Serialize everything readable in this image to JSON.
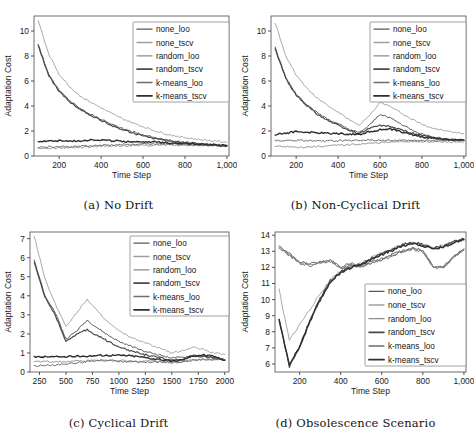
{
  "figure": {
    "series_names": [
      "none_loo",
      "none_tscv",
      "random_loo",
      "random_tscv",
      "k-means_loo",
      "k-means_tscv"
    ],
    "series_colors": [
      "#5a5a5a",
      "#9e9e9e",
      "#8c8c8c",
      "#4a4a4a",
      "#6e6e6e",
      "#2e2e2e"
    ],
    "series_widths": [
      1.0,
      0.9,
      0.9,
      1.2,
      1.0,
      1.4
    ]
  },
  "panels": [
    {
      "id": "a",
      "caption": "(a) No Drift",
      "chart_data": {
        "type": "line",
        "title": "(a) No Drift",
        "xlabel": "Time Step",
        "ylabel": "Adaptation Cost",
        "xlim": [
          80,
          1010
        ],
        "ylim": [
          0,
          11.2
        ],
        "xticks": [
          200,
          400,
          600,
          800,
          1000
        ],
        "xticklabels": [
          "200",
          "400",
          "600",
          "800",
          "1,000"
        ],
        "yticks": [
          0,
          2,
          4,
          6,
          8,
          10
        ],
        "yticklabels": [
          "0",
          "2",
          "4",
          "6",
          "8",
          "10"
        ],
        "grid": false,
        "legend_position": "upper right",
        "x": [
          100,
          150,
          200,
          250,
          300,
          350,
          400,
          450,
          500,
          550,
          600,
          650,
          700,
          750,
          800,
          850,
          900,
          950,
          1000
        ],
        "series": [
          {
            "name": "none_loo",
            "values": [
              8.95,
              6.5,
              5.25,
              4.45,
              3.8,
              3.35,
              2.95,
              2.55,
              2.2,
              1.95,
              1.7,
              1.5,
              1.32,
              1.2,
              1.1,
              1.02,
              0.96,
              0.9,
              0.86
            ]
          },
          {
            "name": "none_tscv",
            "values": [
              10.85,
              8.15,
              6.55,
              5.55,
              4.8,
              4.3,
              3.85,
              3.4,
              3.0,
              2.65,
              2.35,
              2.05,
              1.8,
              1.62,
              1.48,
              1.36,
              1.26,
              1.18,
              1.1
            ]
          },
          {
            "name": "random_loo",
            "values": [
              0.62,
              0.63,
              0.64,
              0.66,
              0.68,
              0.72,
              0.78,
              0.8,
              0.8,
              0.82,
              0.84,
              0.86,
              0.88,
              0.88,
              0.87,
              0.86,
              0.84,
              0.82,
              0.8
            ]
          },
          {
            "name": "random_tscv",
            "values": [
              8.85,
              6.45,
              5.15,
              4.35,
              3.72,
              3.25,
              2.85,
              2.45,
              2.12,
              1.86,
              1.62,
              1.42,
              1.26,
              1.14,
              1.05,
              0.98,
              0.92,
              0.87,
              0.84
            ]
          },
          {
            "name": "k-means_loo",
            "values": [
              0.72,
              0.74,
              0.75,
              0.76,
              0.78,
              0.82,
              0.86,
              0.88,
              0.9,
              0.92,
              0.94,
              0.95,
              0.95,
              0.94,
              0.92,
              0.9,
              0.88,
              0.86,
              0.84
            ]
          },
          {
            "name": "k-means_tscv",
            "values": [
              1.18,
              1.2,
              1.22,
              1.18,
              1.22,
              1.3,
              1.28,
              1.22,
              1.18,
              1.16,
              1.14,
              1.12,
              1.08,
              1.04,
              1.0,
              0.96,
              0.92,
              0.88,
              0.82
            ]
          }
        ]
      }
    },
    {
      "id": "b",
      "caption": "(b) Non-Cyclical Drift",
      "chart_data": {
        "type": "line",
        "title": "(b) Non-Cyclical Drift",
        "xlabel": "Time Step",
        "ylabel": "Adaptation Cost",
        "xlim": [
          80,
          1010
        ],
        "ylim": [
          0,
          11.2
        ],
        "xticks": [
          200,
          400,
          600,
          800,
          1000
        ],
        "xticklabels": [
          "200",
          "400",
          "600",
          "800",
          "1,000"
        ],
        "yticks": [
          0,
          2,
          4,
          6,
          8,
          10
        ],
        "yticklabels": [
          "0",
          "2",
          "4",
          "6",
          "8",
          "10"
        ],
        "grid": false,
        "legend_position": "upper right",
        "x": [
          100,
          150,
          200,
          250,
          300,
          350,
          400,
          450,
          500,
          550,
          600,
          650,
          700,
          750,
          800,
          850,
          900,
          950,
          1000
        ],
        "series": [
          {
            "name": "none_loo",
            "values": [
              8.65,
              6.3,
              4.95,
              4.15,
              3.45,
              2.95,
              2.55,
              2.15,
              1.85,
              2.45,
              3.35,
              3.05,
              2.55,
              2.1,
              1.75,
              1.55,
              1.4,
              1.3,
              1.25
            ]
          },
          {
            "name": "none_tscv",
            "values": [
              10.65,
              8.05,
              6.5,
              5.45,
              4.65,
              4.05,
              3.5,
              2.95,
              2.42,
              3.25,
              4.28,
              3.95,
              3.45,
              2.95,
              2.55,
              2.25,
              2.05,
              1.9,
              1.8
            ]
          },
          {
            "name": "random_loo",
            "values": [
              0.78,
              0.74,
              0.7,
              0.72,
              0.76,
              0.8,
              0.86,
              0.9,
              0.95,
              1.0,
              1.06,
              1.1,
              1.14,
              1.16,
              1.16,
              1.14,
              1.12,
              1.12,
              1.14
            ]
          },
          {
            "name": "random_tscv",
            "values": [
              8.55,
              6.2,
              4.85,
              4.05,
              3.35,
              2.85,
              2.45,
              2.05,
              1.78,
              2.22,
              2.45,
              2.35,
              2.1,
              1.85,
              1.62,
              1.48,
              1.36,
              1.3,
              1.26
            ]
          },
          {
            "name": "k-means_loo",
            "values": [
              1.22,
              1.24,
              1.24,
              1.22,
              1.2,
              1.2,
              1.22,
              1.24,
              1.26,
              1.26,
              1.26,
              1.26,
              1.25,
              1.24,
              1.24,
              1.24,
              1.24,
              1.24,
              1.24
            ]
          },
          {
            "name": "k-means_tscv",
            "values": [
              1.72,
              1.82,
              1.96,
              1.9,
              1.86,
              1.82,
              1.8,
              1.76,
              1.72,
              1.96,
              2.1,
              2.15,
              1.95,
              1.72,
              1.52,
              1.42,
              1.34,
              1.3,
              1.26
            ]
          }
        ]
      }
    },
    {
      "id": "c",
      "caption": "(c) Cyclical Drift",
      "chart_data": {
        "type": "line",
        "title": "(c) Cyclical Drift",
        "xlabel": "Time Step",
        "ylabel": "Adaptation Cost",
        "xlim": [
          160,
          2040
        ],
        "ylim": [
          0,
          7.35
        ],
        "xticks": [
          250,
          500,
          750,
          1000,
          1250,
          1500,
          1750,
          2000
        ],
        "xticklabels": [
          "250",
          "500",
          "750",
          "1000",
          "1250",
          "1500",
          "1750",
          "2000"
        ],
        "yticks": [
          0,
          1,
          2,
          3,
          4,
          5,
          6,
          7
        ],
        "yticklabels": [
          "0",
          "1",
          "2",
          "3",
          "4",
          "5",
          "6",
          "7"
        ],
        "grid": false,
        "legend_position": "upper right",
        "x": [
          200,
          300,
          400,
          500,
          600,
          700,
          800,
          900,
          1000,
          1100,
          1200,
          1300,
          1400,
          1500,
          1600,
          1700,
          1800,
          1900,
          2000
        ],
        "series": [
          {
            "name": "none_loo",
            "values": [
              5.85,
              4.05,
              3.1,
              1.72,
              2.15,
              2.72,
              2.3,
              1.92,
              1.6,
              1.38,
              1.18,
              1.0,
              0.88,
              0.74,
              0.76,
              0.88,
              0.85,
              0.74,
              0.64
            ]
          },
          {
            "name": "none_tscv",
            "values": [
              7.15,
              4.9,
              3.55,
              2.4,
              3.1,
              3.82,
              3.18,
              2.6,
              2.15,
              1.85,
              1.62,
              1.42,
              1.22,
              0.98,
              1.12,
              1.3,
              1.18,
              1.0,
              0.92
            ]
          },
          {
            "name": "random_loo",
            "values": [
              0.55,
              0.54,
              0.54,
              0.55,
              0.57,
              0.6,
              0.62,
              0.62,
              0.6,
              0.58,
              0.56,
              0.56,
              0.56,
              0.55,
              0.58,
              0.62,
              0.64,
              0.64,
              0.64
            ]
          },
          {
            "name": "random_tscv",
            "values": [
              5.75,
              3.95,
              2.98,
              1.58,
              2.0,
              2.22,
              1.9,
              1.6,
              1.34,
              1.14,
              0.98,
              0.84,
              0.74,
              0.62,
              0.66,
              0.8,
              0.82,
              0.74,
              0.62
            ]
          },
          {
            "name": "k-means_loo",
            "values": [
              0.32,
              0.34,
              0.38,
              0.42,
              0.48,
              0.54,
              0.58,
              0.58,
              0.56,
              0.54,
              0.52,
              0.52,
              0.52,
              0.5,
              0.54,
              0.62,
              0.66,
              0.66,
              0.66
            ]
          },
          {
            "name": "k-means_tscv",
            "values": [
              0.78,
              0.8,
              0.8,
              0.8,
              0.82,
              0.84,
              0.86,
              0.88,
              0.88,
              0.86,
              0.8,
              0.72,
              0.64,
              0.56,
              0.64,
              0.86,
              0.9,
              0.82,
              0.62
            ]
          }
        ]
      }
    },
    {
      "id": "d",
      "caption": "(d) Obsolescence Scenario",
      "chart_data": {
        "type": "line",
        "title": "(d) Obsolescence Scenario",
        "xlabel": "Time Step",
        "ylabel": "Adaptation Cost",
        "xlim": [
          80,
          1010
        ],
        "ylim": [
          5.5,
          14.2
        ],
        "xticks": [
          200,
          400,
          600,
          800,
          1000
        ],
        "xticklabels": [
          "200",
          "400",
          "600",
          "800",
          "1,000"
        ],
        "yticks": [
          6,
          7,
          8,
          9,
          10,
          11,
          12,
          13,
          14
        ],
        "yticklabels": [
          "6",
          "7",
          "8",
          "9",
          "10",
          "11",
          "12",
          "13",
          "14"
        ],
        "grid": false,
        "legend_position": "center right",
        "x": [
          100,
          150,
          200,
          250,
          300,
          350,
          400,
          450,
          500,
          550,
          600,
          650,
          700,
          750,
          800,
          850,
          900,
          950,
          1000
        ],
        "series": [
          {
            "name": "none_loo",
            "values": [
              13.3,
              12.85,
              12.35,
              12.2,
              12.35,
              12.45,
              12.05,
              12.25,
              12.1,
              12.35,
              12.55,
              12.8,
              13.05,
              13.2,
              13.05,
              12.1,
              12.05,
              12.7,
              13.15
            ]
          },
          {
            "name": "none_tscv",
            "values": [
              10.6,
              7.45,
              8.45,
              9.4,
              10.35,
              11.25,
              11.8,
              12.1,
              12.25,
              12.6,
              12.9,
              13.15,
              13.45,
              13.6,
              13.45,
              13.25,
              13.35,
              13.65,
              13.8
            ]
          },
          {
            "name": "random_loo",
            "values": [
              13.25,
              12.8,
              12.3,
              12.15,
              12.3,
              12.42,
              12.0,
              12.2,
              12.05,
              12.3,
              12.5,
              12.75,
              13.0,
              13.15,
              13.0,
              12.05,
              12.0,
              12.65,
              13.1
            ]
          },
          {
            "name": "random_tscv",
            "values": [
              8.8,
              5.85,
              7.1,
              8.7,
              10.05,
              11.15,
              11.75,
              12.05,
              12.2,
              12.55,
              12.85,
              13.1,
              13.4,
              13.55,
              13.4,
              13.2,
              13.3,
              13.6,
              13.75
            ]
          },
          {
            "name": "k-means_loo",
            "values": [
              13.2,
              12.75,
              12.25,
              12.1,
              12.25,
              12.38,
              11.95,
              12.15,
              12.02,
              12.28,
              12.48,
              12.72,
              12.98,
              13.12,
              12.98,
              12.02,
              11.98,
              12.62,
              13.08
            ]
          },
          {
            "name": "k-means_tscv",
            "values": [
              8.7,
              5.95,
              7.05,
              8.6,
              9.95,
              11.1,
              11.7,
              12.0,
              12.15,
              12.5,
              12.8,
              13.05,
              13.35,
              13.5,
              13.35,
              13.15,
              13.25,
              13.55,
              13.72
            ]
          }
        ]
      }
    }
  ]
}
